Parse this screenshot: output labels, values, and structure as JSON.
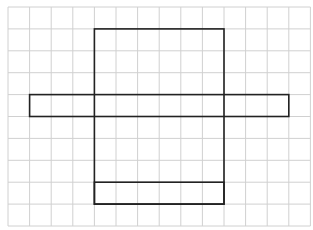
{
  "diagram": {
    "type": "cube-net-on-grid",
    "grid": {
      "columns": 14,
      "rows": 10,
      "origin_x": 8,
      "origin_y": 7,
      "cell_width": 21.6,
      "cell_height": 21.9,
      "line_color": "#d0d0d0"
    },
    "shapes": [
      {
        "name": "tall-rectangle",
        "col": 4,
        "row": 1,
        "cols": 6,
        "rows": 8
      },
      {
        "name": "horizontal-bar",
        "col": 1,
        "row": 4,
        "cols": 12,
        "rows": 1
      },
      {
        "name": "bottom-strip",
        "col": 4,
        "row": 8,
        "cols": 6,
        "rows": 1
      }
    ],
    "stroke_color": "#222222"
  }
}
